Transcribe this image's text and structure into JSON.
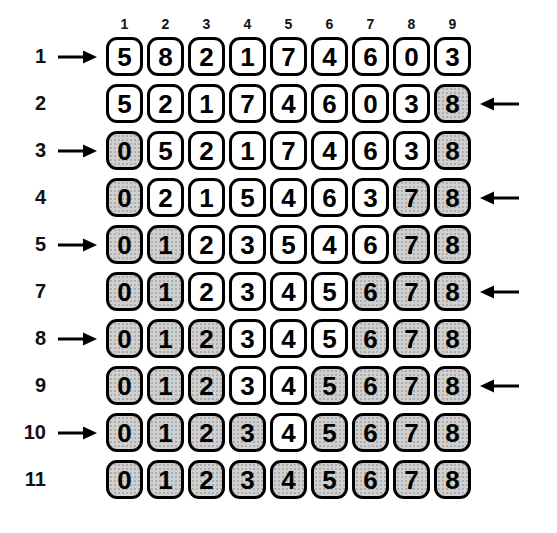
{
  "diagram": {
    "column_headers": [
      "1",
      "2",
      "3",
      "4",
      "5",
      "6",
      "7",
      "8",
      "9"
    ],
    "rows": [
      {
        "label": "1",
        "arrow": "right",
        "values": [
          "5",
          "8",
          "2",
          "1",
          "7",
          "4",
          "6",
          "0",
          "3"
        ],
        "shaded": [
          false,
          false,
          false,
          false,
          false,
          false,
          false,
          false,
          false
        ]
      },
      {
        "label": "2",
        "arrow": "left",
        "values": [
          "5",
          "2",
          "1",
          "7",
          "4",
          "6",
          "0",
          "3",
          "8"
        ],
        "shaded": [
          false,
          false,
          false,
          false,
          false,
          false,
          false,
          false,
          true
        ]
      },
      {
        "label": "3",
        "arrow": "right",
        "values": [
          "0",
          "5",
          "2",
          "1",
          "7",
          "4",
          "6",
          "3",
          "8"
        ],
        "shaded": [
          true,
          false,
          false,
          false,
          false,
          false,
          false,
          false,
          true
        ]
      },
      {
        "label": "4",
        "arrow": "left",
        "values": [
          "0",
          "2",
          "1",
          "5",
          "4",
          "6",
          "3",
          "7",
          "8"
        ],
        "shaded": [
          true,
          false,
          false,
          false,
          false,
          false,
          false,
          true,
          true
        ]
      },
      {
        "label": "5",
        "arrow": "right",
        "values": [
          "0",
          "1",
          "2",
          "3",
          "5",
          "4",
          "6",
          "7",
          "8"
        ],
        "shaded": [
          true,
          true,
          false,
          false,
          false,
          false,
          false,
          true,
          true
        ]
      },
      {
        "label": "7",
        "arrow": "left",
        "values": [
          "0",
          "1",
          "2",
          "3",
          "4",
          "5",
          "6",
          "7",
          "8"
        ],
        "shaded": [
          true,
          true,
          false,
          false,
          false,
          false,
          true,
          true,
          true
        ]
      },
      {
        "label": "8",
        "arrow": "right",
        "values": [
          "0",
          "1",
          "2",
          "3",
          "4",
          "5",
          "6",
          "7",
          "8"
        ],
        "shaded": [
          true,
          true,
          true,
          false,
          false,
          false,
          true,
          true,
          true
        ]
      },
      {
        "label": "9",
        "arrow": "left",
        "values": [
          "0",
          "1",
          "2",
          "3",
          "4",
          "5",
          "6",
          "7",
          "8"
        ],
        "shaded": [
          true,
          true,
          true,
          false,
          false,
          true,
          true,
          true,
          true
        ]
      },
      {
        "label": "10",
        "arrow": "right",
        "values": [
          "0",
          "1",
          "2",
          "3",
          "4",
          "5",
          "6",
          "7",
          "8"
        ],
        "shaded": [
          true,
          true,
          true,
          true,
          false,
          true,
          true,
          true,
          true
        ]
      },
      {
        "label": "11",
        "arrow": "none",
        "values": [
          "0",
          "1",
          "2",
          "3",
          "4",
          "5",
          "6",
          "7",
          "8"
        ],
        "shaded": [
          true,
          true,
          true,
          true,
          true,
          true,
          true,
          true,
          true
        ]
      }
    ]
  },
  "colors": {
    "border": "#000000",
    "cell_fill": "#ffffff",
    "cell_shaded_fill": "#d0d0d0",
    "cell_shaded_dot": "#a8a8a8",
    "background": "#ffffff"
  }
}
